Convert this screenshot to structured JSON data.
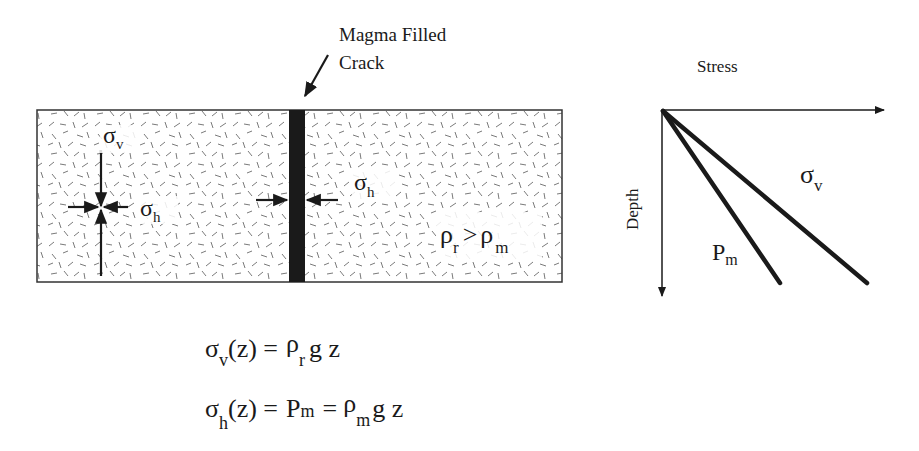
{
  "crack_label": {
    "line1": "Magma Filled",
    "line2": "Crack"
  },
  "rock_block": {
    "left_stress": {
      "sigma": "σ",
      "v_sub": "v",
      "h_sub": "h"
    },
    "crack_stress": {
      "sigma": "σ",
      "h_sub": "h"
    },
    "density_relation": {
      "rho": "ρ",
      "r_sub": "r",
      "op": ">",
      "m_sub": "m"
    }
  },
  "graph": {
    "x_axis_label": "Stress",
    "y_axis_label": "Depth",
    "lines": [
      {
        "name": "P",
        "sub": "m"
      },
      {
        "name": "σ",
        "sub": "v"
      }
    ]
  },
  "equations": {
    "eq1": {
      "lhs": "σ",
      "lhs_sub": "v",
      "arg": "(z) =",
      "rho": "ρ",
      "rho_sub": "r",
      "tail": "g z"
    },
    "eq2": {
      "lhs": "σ",
      "lhs_sub": "h",
      "arg": "(z) =",
      "mid": "P",
      "mid_sub": "m",
      "eq": "=",
      "rho": "ρ",
      "rho_sub": "m",
      "tail": "g z"
    }
  },
  "colors": {
    "ink": "#1a1a1a",
    "magma": "#1a1a1a",
    "texture": "#666666"
  }
}
